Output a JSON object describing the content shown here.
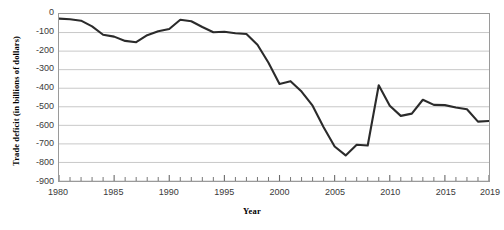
{
  "chart_data": {
    "type": "line",
    "title": "",
    "xlabel": "Year",
    "ylabel": "Trade deficit (in billions of dollars)",
    "xlim": [
      1980,
      2019
    ],
    "ylim": [
      -900,
      0
    ],
    "grid": true,
    "legend_position": "none",
    "line_color": "#2b2b2b",
    "grid_color": "#c8c8c8",
    "axis_color": "#9a9a9a",
    "x_major_ticks": [
      1980,
      1985,
      1990,
      1995,
      2000,
      2005,
      2010,
      2015,
      2019
    ],
    "x_major_tick_labels": [
      "1980",
      "1985",
      "1990",
      "1995",
      "2000",
      "2005",
      "2010",
      "2015",
      "2019"
    ],
    "x_minor_tick_interval": 1,
    "y_ticks": [
      0,
      -100,
      -200,
      -300,
      -400,
      -500,
      -600,
      -700,
      -800,
      -900
    ],
    "y_tick_labels": [
      "0",
      "-100",
      "-200",
      "-300",
      "-400",
      "-500",
      "-600",
      "-700",
      "-800",
      "-900"
    ],
    "x": [
      1980,
      1981,
      1982,
      1983,
      1984,
      1985,
      1986,
      1987,
      1988,
      1989,
      1990,
      1991,
      1992,
      1993,
      1994,
      1995,
      1996,
      1997,
      1998,
      1999,
      2000,
      2001,
      2002,
      2003,
      2004,
      2005,
      2006,
      2007,
      2008,
      2009,
      2010,
      2011,
      2012,
      2013,
      2014,
      2015,
      2016,
      2017,
      2018,
      2019
    ],
    "values": [
      -25,
      -28,
      -36,
      -67,
      -112,
      -122,
      -145,
      -152,
      -114,
      -93,
      -81,
      -31,
      -39,
      -70,
      -98,
      -96,
      -104,
      -108,
      -166,
      -263,
      -377,
      -362,
      -418,
      -494,
      -610,
      -714,
      -762,
      -705,
      -709,
      -384,
      -494,
      -549,
      -537,
      -462,
      -490,
      -491,
      -504,
      -513,
      -580,
      -577
    ]
  },
  "axis": {
    "x_label": "Year",
    "y_label": "Trade deficit (in billions of dollars)"
  }
}
